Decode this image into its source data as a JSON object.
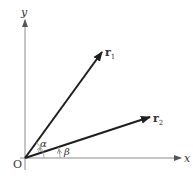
{
  "diagram": {
    "axes": {
      "x_label": "x",
      "y_label": "y",
      "origin_label": "O"
    },
    "vectors": [
      {
        "name": "r",
        "subscript": "1",
        "angle_label": "α"
      },
      {
        "name": "r",
        "subscript": "2",
        "angle_label": "β"
      }
    ],
    "colors": {
      "axis": "#8c8c8c",
      "vector": "#1e1e1e",
      "arc": "#999999",
      "text": "#333333"
    }
  }
}
